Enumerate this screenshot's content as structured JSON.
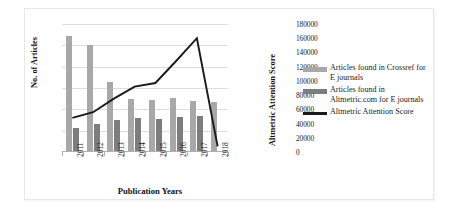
{
  "chart_data": {
    "type": "bar",
    "title": "",
    "xlabel": "Publication Years",
    "ylabel": "No. of Articles",
    "y2label": "Altmetric Attention Score",
    "categories": [
      "2011",
      "2012",
      "2013",
      "2014",
      "2015",
      "2016",
      "2017",
      "2018"
    ],
    "ylim": [
      0,
      60000
    ],
    "yticks": [
      "60000",
      "50000",
      "40000",
      "30000",
      "20000",
      "10000",
      "0"
    ],
    "ytick_values": [
      60000,
      50000,
      40000,
      30000,
      20000,
      10000,
      0
    ],
    "y2lim": [
      0,
      180000
    ],
    "y2ticks": [
      "180000",
      "160000",
      "140000",
      "120000",
      "100000",
      "80000",
      "60000",
      "40000",
      "20000",
      "0"
    ],
    "y2tick_values": [
      180000,
      160000,
      140000,
      120000,
      100000,
      80000,
      60000,
      40000,
      20000,
      0
    ],
    "grid": true,
    "legend_position": "right",
    "series": [
      {
        "name": "Articles found in Crossref for E journals",
        "type": "bar",
        "axis": "left",
        "color": "#a8a8a8",
        "values": [
          54500,
          50000,
          33000,
          24700,
          24200,
          25500,
          24000,
          23500
        ]
      },
      {
        "name": "Articles found in Altmetric.com for E journals",
        "type": "bar",
        "axis": "left",
        "color": "#7d7d7d",
        "values": [
          11200,
          13200,
          15200,
          16000,
          15500,
          16500,
          17000,
          300
        ]
      },
      {
        "name": "Altmetric Attention Score",
        "type": "line",
        "axis": "right",
        "color": "#1a1a1a",
        "values": [
          48000,
          56000,
          75000,
          92000,
          97000,
          128000,
          160000,
          8000
        ]
      }
    ]
  },
  "legend": {
    "items": [
      {
        "label_line1": "Articles found in Crossref for",
        "label_line2": "E journals",
        "swatch": "#a8a8a8",
        "kind": "bar"
      },
      {
        "label_line1": "Articles found in",
        "label_line2": "Altmetric.com for E journals",
        "swatch": "#7d7d7d",
        "kind": "bar"
      },
      {
        "label_line1": "Altmetric Attention Score",
        "label_line2": "",
        "swatch": "#1a1a1a",
        "kind": "line"
      }
    ]
  }
}
